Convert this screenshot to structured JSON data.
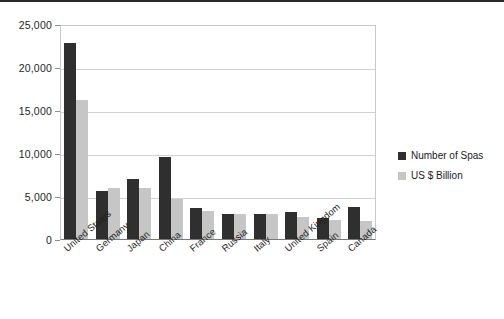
{
  "chart_data": {
    "type": "bar",
    "title": "",
    "subtitle": "",
    "xlabel": "",
    "ylabel": "",
    "ylim": [
      0,
      25000
    ],
    "ytick_values": [
      0,
      5000,
      10000,
      15000,
      20000,
      25000
    ],
    "ytick_labels": [
      "0",
      "5,000",
      "10,000",
      "15,000",
      "20,000",
      "25,000"
    ],
    "grid": true,
    "legend_position": "right",
    "categories": [
      "United States",
      "Germany",
      "Japan",
      "China",
      "France",
      "Russia",
      "Italy",
      "United Kingdom",
      "Spain",
      "Canada"
    ],
    "series": [
      {
        "name": "Number of Spas",
        "color": "#2f2f2f",
        "values": [
          22800,
          5600,
          7000,
          9500,
          3600,
          2900,
          2900,
          3100,
          2500,
          3700
        ]
      },
      {
        "name": "US $ Billion",
        "color": "#c6c6c6",
        "values": [
          16200,
          5900,
          5900,
          4700,
          3200,
          2900,
          2900,
          2600,
          2200,
          2100
        ]
      }
    ]
  },
  "legend": {
    "items": [
      {
        "label": "Number of Spas",
        "color": "#2f2f2f"
      },
      {
        "label": "US $ Billion",
        "color": "#c6c6c6"
      }
    ]
  },
  "colors": {
    "series_dark": "#2f2f2f",
    "series_light": "#c6c6c6",
    "gridline": "#d2d2d2",
    "axis": "#7a7a7a",
    "text": "#1a1a1a",
    "background": "#ffffff"
  }
}
